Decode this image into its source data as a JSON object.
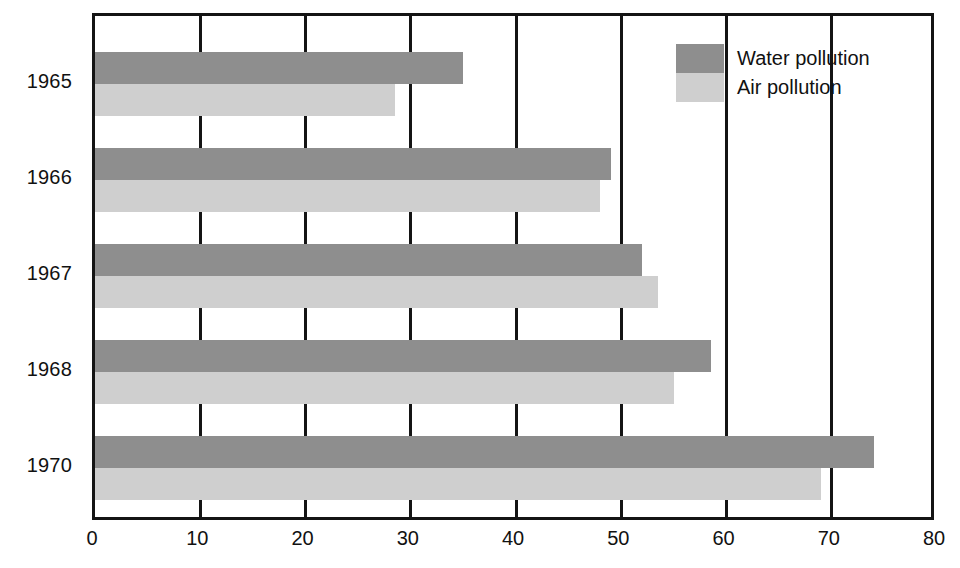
{
  "chart_data": {
    "type": "bar",
    "orientation": "horizontal",
    "title": "",
    "xlabel": "",
    "ylabel": "",
    "categories": [
      "1965",
      "1966",
      "1967",
      "1968",
      "1970"
    ],
    "series": [
      {
        "name": "Water pollution",
        "color": "#8e8e8e",
        "values": [
          35,
          49,
          52,
          58.5,
          74
        ]
      },
      {
        "name": "Air pollution",
        "color": "#cfcfcf",
        "values": [
          28.5,
          48,
          53.5,
          55,
          69
        ]
      }
    ],
    "xlim": [
      0,
      80
    ],
    "xticks": [
      0,
      10,
      20,
      30,
      40,
      50,
      60,
      70,
      80
    ],
    "xticklabels": [
      "0",
      "10",
      "20",
      "30",
      "40",
      "50",
      "60",
      "70",
      "80"
    ],
    "grid": "vertical-only",
    "legend_position": "top-right",
    "frame_color": "#141414",
    "background": "#ffffff"
  },
  "legend": {
    "items": [
      {
        "label": "Water pollution",
        "swatch": "water"
      },
      {
        "label": "Air pollution",
        "swatch": "air"
      }
    ]
  }
}
